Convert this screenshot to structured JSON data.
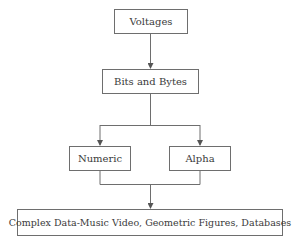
{
  "diagram": {
    "type": "flowchart",
    "nodes": [
      {
        "id": "voltages",
        "label": "Voltages"
      },
      {
        "id": "bits",
        "label": "Bits and Bytes"
      },
      {
        "id": "numeric",
        "label": "Numeric"
      },
      {
        "id": "alpha",
        "label": "Alpha"
      },
      {
        "id": "complex",
        "label": "Complex Data-Music Video, Geometric Figures, Databases"
      }
    ],
    "edges": [
      {
        "from": "voltages",
        "to": "bits"
      },
      {
        "from": "bits",
        "to": "numeric"
      },
      {
        "from": "bits",
        "to": "alpha"
      },
      {
        "from": "numeric",
        "to": "complex"
      },
      {
        "from": "alpha",
        "to": "complex"
      }
    ],
    "colors": {
      "line": "#6e6e6e",
      "text": "#3a3a3a"
    }
  }
}
